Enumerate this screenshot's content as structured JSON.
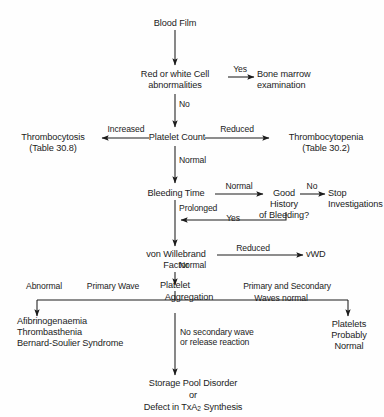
{
  "figure": {
    "line_color": "#1c1c1c",
    "text_color": "#1c1c1c",
    "background_color": "#fefefe"
  },
  "nodes": {
    "blood_film": "Blood Film",
    "cell_abnormalities": "Red or white Cell\nabnormalities",
    "bone_marrow": "Bone marrow\nexamination",
    "platelet_count": "Platelet Count",
    "thrombocytosis": "Thrombocytosis\n(Table 30.8)",
    "thrombocytopenia": "Thrombocytopenia\n(Table 30.2)",
    "bleeding_time": "Bleeding Time",
    "good_history": "Good\nHistory\nof Bleeding?",
    "stop_investigations": "Stop\nInvestigations",
    "von_willebrand": "von Willebrand\nFactor",
    "vwd": "vWD",
    "platelet_aggregation_line1": "Platelet",
    "platelet_aggregation_line2": "Aggregation",
    "left_outcome": "Afibrinogenaemia\nThrombasthenia\nBernard-Soulier Syndrome",
    "right_outcome": "Platelets\nProbably\nNormal",
    "bottom_outcome_line1": "Storage Pool Disorder",
    "bottom_outcome_line2": "or",
    "bottom_outcome_line3_pre": "Defect in TxA",
    "bottom_outcome_line3_sub": "2",
    "bottom_outcome_line3_post": " Synthesis"
  },
  "edge_labels": {
    "yes_bone_marrow": "Yes",
    "no_platelet_count": "No",
    "increased": "Increased",
    "reduced_platelet": "Reduced",
    "normal_bleeding_time": "Normal",
    "normal_history": "Normal",
    "no_stop": "No",
    "prolonged": "Prolonged",
    "yes_loopback": "Yes",
    "reduced_vwf": "Reduced",
    "normal_vwf": "Normal",
    "abnormal": "Abnormal",
    "primary_wave": "Primary Wave",
    "primary_and_secondary": "Primary and Secondary",
    "waves_normal": "Waves normal",
    "no_secondary": "No secondary wave\nor release reaction"
  }
}
